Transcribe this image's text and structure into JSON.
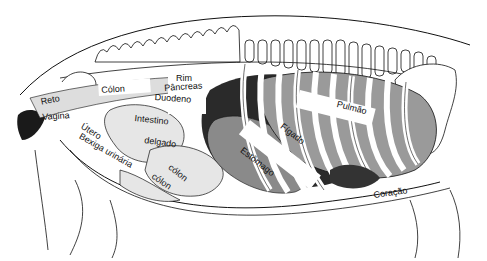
{
  "diagram": {
    "style": "black-and-white line drawing with shading",
    "colors": {
      "ink": "#111111",
      "dark_shade": "#2a2a2a",
      "mid_shade": "#8a8a8a",
      "light_shade": "#cfcfcf",
      "paper": "#ffffff"
    },
    "labels": {
      "reto": "Reto",
      "vagina": "Vagina",
      "utero": "Útero",
      "bexiga": "Bexiga urinária",
      "colon_top": "Cólon",
      "rim": "Rim",
      "pancreas": "Pâncreas",
      "duodeno": "Duodeno",
      "intestino": "Intestino",
      "delgado": "delgado",
      "colon_lower1": "cólon",
      "colon_lower2": "cólon",
      "estomago": "Estômago",
      "figado": "Fígado",
      "pulmao": "Pulmão",
      "coracao": "Coração"
    }
  }
}
